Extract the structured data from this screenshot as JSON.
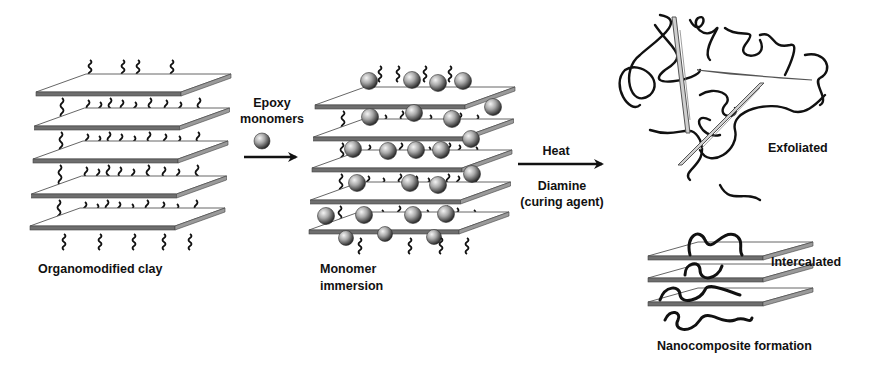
{
  "diagram": {
    "colors": {
      "plate_edge": "#6e6e6e",
      "plate_top": "#ffffff",
      "chain": "#111111",
      "sphere_light": "#f2f2f2",
      "sphere_dark": "#2a2a2a",
      "text": "#111111"
    },
    "stages": [
      {
        "id": "organoclay",
        "label": "Organomodified clay",
        "layers": 5
      },
      {
        "id": "immersion",
        "label_lines": [
          "Monomer",
          "immersion"
        ],
        "layers": 5
      },
      {
        "id": "exfoliated",
        "label": "Exfoliated"
      },
      {
        "id": "intercalated",
        "label": "Intercalated",
        "layers": 3
      }
    ],
    "arrows": [
      {
        "id": "epoxy-arrow",
        "label_lines": [
          "Epoxy",
          "monomers"
        ],
        "icon": "monomer-sphere-icon"
      },
      {
        "id": "cure-arrow",
        "label_top": "Heat",
        "label_bottom_lines": [
          "Diamine",
          "(curing agent)"
        ]
      }
    ],
    "footer_label": "Nanocomposite formation"
  }
}
